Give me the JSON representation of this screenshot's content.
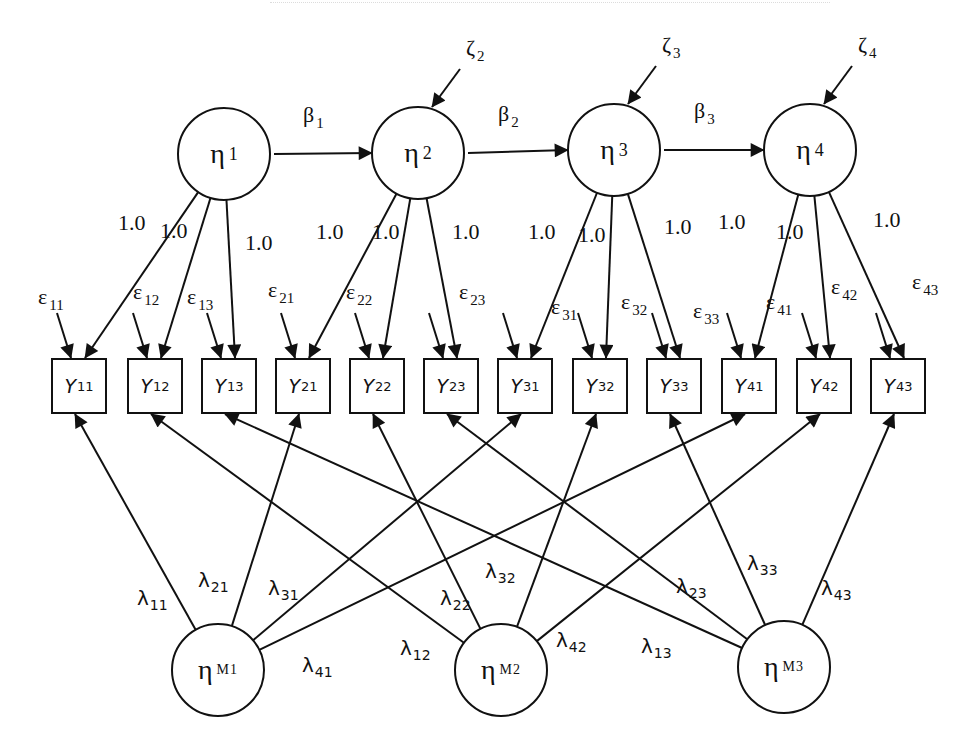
{
  "diagram": {
    "type": "structural-equation-model",
    "trait_factors": [
      {
        "id": "eta1",
        "symbol": "η",
        "sub": "1",
        "cx": 224,
        "cy": 154
      },
      {
        "id": "eta2",
        "symbol": "η",
        "sub": "2",
        "cx": 418,
        "cy": 153
      },
      {
        "id": "eta3",
        "symbol": "η",
        "sub": "3",
        "cx": 614,
        "cy": 150
      },
      {
        "id": "eta4",
        "symbol": "η",
        "sub": "4",
        "cx": 810,
        "cy": 150
      }
    ],
    "method_factors": [
      {
        "id": "etaM1",
        "symbol": "η",
        "sub": "M1",
        "cx": 218,
        "cy": 670
      },
      {
        "id": "etaM2",
        "symbol": "η",
        "sub": "M2",
        "cx": 501,
        "cy": 670
      },
      {
        "id": "etaM3",
        "symbol": "η",
        "sub": "M3",
        "cx": 784,
        "cy": 667
      }
    ],
    "paths": [
      {
        "label": "β",
        "sub": "1",
        "from": "eta1",
        "to": "eta2"
      },
      {
        "label": "β",
        "sub": "2",
        "from": "eta2",
        "to": "eta3"
      },
      {
        "label": "β",
        "sub": "3",
        "from": "eta3",
        "to": "eta4"
      }
    ],
    "disturbances": [
      {
        "label": "ζ",
        "sub": "2",
        "target": "eta2"
      },
      {
        "label": "ζ",
        "sub": "3",
        "target": "eta3"
      },
      {
        "label": "ζ",
        "sub": "4",
        "target": "eta4"
      }
    ],
    "indicators": [
      {
        "id": "Y11",
        "letter": "Y",
        "sub": "11",
        "x": 52,
        "trait": "eta1",
        "method": "etaM1"
      },
      {
        "id": "Y12",
        "letter": "Y",
        "sub": "12",
        "x": 128,
        "trait": "eta1",
        "method": "etaM2"
      },
      {
        "id": "Y13",
        "letter": "Y",
        "sub": "13",
        "x": 202,
        "trait": "eta1",
        "method": "etaM3"
      },
      {
        "id": "Y21",
        "letter": "Y",
        "sub": "21",
        "x": 276,
        "trait": "eta2",
        "method": "etaM1"
      },
      {
        "id": "Y22",
        "letter": "Y",
        "sub": "22",
        "x": 350,
        "trait": "eta2",
        "method": "etaM2"
      },
      {
        "id": "Y23",
        "letter": "Y",
        "sub": "23",
        "x": 424,
        "trait": "eta2",
        "method": "etaM3"
      },
      {
        "id": "Y31",
        "letter": "Y",
        "sub": "31",
        "x": 498,
        "trait": "eta3",
        "method": "etaM1"
      },
      {
        "id": "Y32",
        "letter": "Y",
        "sub": "32",
        "x": 573,
        "trait": "eta3",
        "method": "etaM2"
      },
      {
        "id": "Y33",
        "letter": "Y",
        "sub": "33",
        "x": 647,
        "trait": "eta3",
        "method": "etaM3"
      },
      {
        "id": "Y41",
        "letter": "Y",
        "sub": "41",
        "x": 722,
        "trait": "eta4",
        "method": "etaM1"
      },
      {
        "id": "Y42",
        "letter": "Y",
        "sub": "42",
        "x": 797,
        "trait": "eta4",
        "method": "etaM2"
      },
      {
        "id": "Y43",
        "letter": "Y",
        "sub": "43",
        "x": 871,
        "trait": "eta4",
        "method": "etaM3"
      }
    ],
    "trait_loading_value": "1.0",
    "trait_loadings": [
      {
        "value": "1.0",
        "x": 118,
        "y": 212
      },
      {
        "value": "1.0",
        "x": 160,
        "y": 220
      },
      {
        "value": "1.0",
        "x": 245,
        "y": 232
      },
      {
        "value": "1.0",
        "x": 316,
        "y": 221
      },
      {
        "value": "1.0",
        "x": 372,
        "y": 221
      },
      {
        "value": "1.0",
        "x": 452,
        "y": 221
      },
      {
        "value": "1.0",
        "x": 528,
        "y": 221
      },
      {
        "value": "1.0",
        "x": 578,
        "y": 224
      },
      {
        "value": "1.0",
        "x": 664,
        "y": 216
      },
      {
        "value": "1.0",
        "x": 718,
        "y": 211
      },
      {
        "value": "1.0",
        "x": 776,
        "y": 221
      },
      {
        "value": "1.0",
        "x": 873,
        "y": 209
      }
    ],
    "errors": [
      {
        "label": "ε",
        "sub": "11",
        "x": 38,
        "y": 286
      },
      {
        "label": "ε",
        "sub": "12",
        "x": 133,
        "y": 281
      },
      {
        "label": "ε",
        "sub": "13",
        "x": 187,
        "y": 286
      },
      {
        "label": "ε",
        "sub": "21",
        "x": 268,
        "y": 279
      },
      {
        "label": "ε",
        "sub": "22",
        "x": 346,
        "y": 281
      },
      {
        "label": "ε",
        "sub": "23",
        "x": 459,
        "y": 281
      },
      {
        "label": "ε",
        "sub": "31",
        "x": 551,
        "y": 296
      },
      {
        "label": "ε",
        "sub": "32",
        "x": 621,
        "y": 291
      },
      {
        "label": "ε",
        "sub": "33",
        "x": 693,
        "y": 300
      },
      {
        "label": "ε",
        "sub": "41",
        "x": 766,
        "y": 291
      },
      {
        "label": "ε",
        "sub": "42",
        "x": 831,
        "y": 276
      },
      {
        "label": "ε",
        "sub": "43",
        "x": 912,
        "y": 271
      }
    ],
    "method_loadings": [
      {
        "label": "λ",
        "sub": "11",
        "x": 137,
        "y": 588
      },
      {
        "label": "λ",
        "sub": "21",
        "x": 198,
        "y": 570
      },
      {
        "label": "λ",
        "sub": "31",
        "x": 268,
        "y": 578
      },
      {
        "label": "λ",
        "sub": "41",
        "x": 302,
        "y": 655
      },
      {
        "label": "λ",
        "sub": "12",
        "x": 400,
        "y": 638
      },
      {
        "label": "λ",
        "sub": "22",
        "x": 440,
        "y": 588
      },
      {
        "label": "λ",
        "sub": "32",
        "x": 485,
        "y": 561
      },
      {
        "label": "λ",
        "sub": "42",
        "x": 556,
        "y": 630
      },
      {
        "label": "λ",
        "sub": "13",
        "x": 641,
        "y": 636
      },
      {
        "label": "λ",
        "sub": "23",
        "x": 676,
        "y": 576
      },
      {
        "label": "λ",
        "sub": "33",
        "x": 747,
        "y": 553
      },
      {
        "label": "λ",
        "sub": "43",
        "x": 821,
        "y": 578
      }
    ],
    "colors": {
      "stroke": "#111111",
      "background": "#ffffff"
    }
  }
}
